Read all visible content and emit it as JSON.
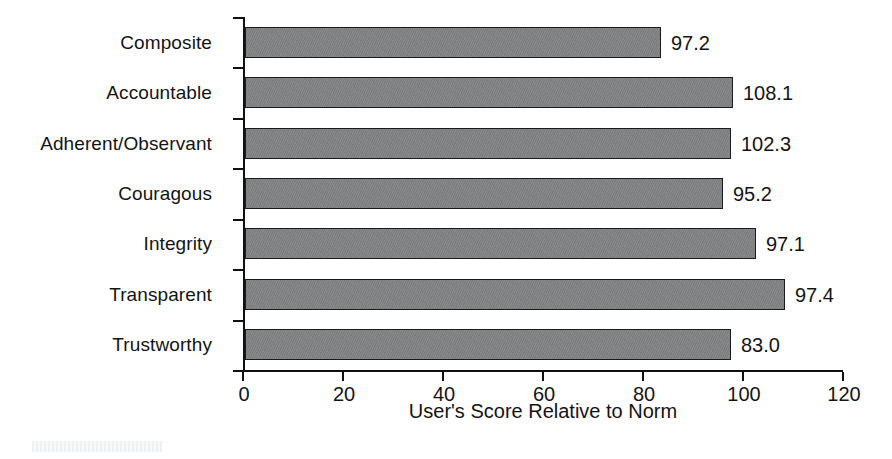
{
  "chart_data": {
    "type": "bar",
    "orientation": "horizontal",
    "title": "",
    "xlabel": "User's Score Relative to Norm",
    "ylabel": "",
    "xlim": [
      0,
      120
    ],
    "xticks": [
      0,
      20,
      40,
      60,
      80,
      100,
      120
    ],
    "xtick_labels": [
      "0",
      "20",
      "40",
      "60",
      "80",
      "100",
      "120"
    ],
    "grid": false,
    "legend": false,
    "bar_color": "#808284",
    "bar_edge_color": "#1b1b1b",
    "categories": [
      "Composite",
      "Accountable",
      "Adherent/Observant",
      "Couragous",
      "Integrity",
      "Transparent",
      "Trustworthy"
    ],
    "data_labels": [
      "97.2",
      "108.1",
      "102.3",
      "95.2",
      "97.1",
      "97.4",
      "83.0"
    ],
    "values": [
      97.2,
      108.1,
      102.3,
      95.2,
      97.1,
      97.4,
      83.0
    ],
    "drawn_bar_lengths": [
      83.2,
      97.6,
      97.2,
      95.6,
      102.2,
      108.0,
      97.2
    ],
    "bars": [
      {
        "category": "Composite",
        "label": "97.2",
        "value": 97.2,
        "drawn_length": 83.2
      },
      {
        "category": "Accountable",
        "label": "108.1",
        "value": 108.1,
        "drawn_length": 97.6
      },
      {
        "category": "Adherent/Observant",
        "label": "102.3",
        "value": 102.3,
        "drawn_length": 97.2
      },
      {
        "category": "Couragous",
        "label": "95.2",
        "value": 95.2,
        "drawn_length": 95.6
      },
      {
        "category": "Integrity",
        "label": "97.1",
        "value": 97.1,
        "drawn_length": 102.2
      },
      {
        "category": "Transparent",
        "label": "97.4",
        "value": 97.4,
        "drawn_length": 108.0
      },
      {
        "category": "Trustworthy",
        "label": "83.0",
        "value": 83.0,
        "drawn_length": 97.2
      }
    ]
  }
}
